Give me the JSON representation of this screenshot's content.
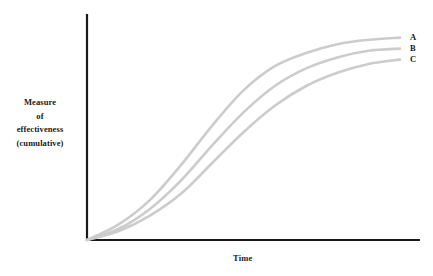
{
  "chart_data": {
    "type": "line",
    "title": "",
    "subtitle": "",
    "xlabel": "Time",
    "ylabel": "Measure of effectiveness (cumulative)",
    "ylabel_lines": [
      "Measure",
      "of",
      "effectiveness",
      "(cumulative)"
    ],
    "grid": false,
    "legend_position": "right-end-of-line",
    "axis_ticks": false,
    "tick_labels": {
      "x": [],
      "y": []
    },
    "xlim": [
      0,
      100
    ],
    "ylim": [
      0,
      100
    ],
    "x": [
      0,
      10,
      20,
      30,
      40,
      50,
      60,
      70,
      80,
      90,
      100
    ],
    "series": [
      {
        "name": "A",
        "label": "A",
        "color": "#cccccc",
        "values": [
          0,
          7,
          18,
          34,
          52,
          68,
          79,
          85,
          89,
          91,
          92
        ]
      },
      {
        "name": "B",
        "label": "B",
        "color": "#cccccc",
        "values": [
          0,
          5,
          14,
          27,
          43,
          58,
          70,
          78,
          83,
          86,
          87
        ]
      },
      {
        "name": "C",
        "label": "C",
        "color": "#cccccc",
        "values": [
          0,
          4,
          11,
          21,
          35,
          49,
          61,
          70,
          76,
          80,
          82
        ]
      }
    ],
    "colors": {
      "curve": "#cccccc",
      "axis": "#1a1a1a",
      "text": "#1a1a1a",
      "background": "#ffffff"
    }
  }
}
